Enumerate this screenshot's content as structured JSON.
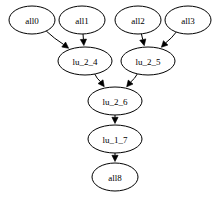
{
  "graph": {
    "kind": "directed-acyclic-graph",
    "layout": "top-to-bottom",
    "background_color": "#ffffff",
    "node_fill_color": "#ffffff",
    "node_stroke_color": "#000000",
    "edge_color": "#000000",
    "label_color": "#000000",
    "nodes": [
      {
        "id": "all0",
        "label": "all0",
        "cx": 32,
        "cy": 20,
        "rx": 23,
        "ry": 14,
        "layer": 0
      },
      {
        "id": "all1",
        "label": "all1",
        "cx": 82,
        "cy": 20,
        "rx": 23,
        "ry": 14,
        "layer": 0
      },
      {
        "id": "all2",
        "label": "all2",
        "cx": 138,
        "cy": 20,
        "rx": 23,
        "ry": 14,
        "layer": 0
      },
      {
        "id": "all3",
        "label": "all3",
        "cx": 188,
        "cy": 20,
        "rx": 23,
        "ry": 14,
        "layer": 0
      },
      {
        "id": "lu_2_4",
        "label": "lu_2_4",
        "cx": 85,
        "cy": 61,
        "rx": 27,
        "ry": 14,
        "layer": 1
      },
      {
        "id": "lu_2_5",
        "label": "lu_2_5",
        "cx": 148,
        "cy": 61,
        "rx": 27,
        "ry": 14,
        "layer": 1
      },
      {
        "id": "lu_2_6",
        "label": "lu_2_6",
        "cx": 115,
        "cy": 101,
        "rx": 27,
        "ry": 14,
        "layer": 2
      },
      {
        "id": "lu_1_7",
        "label": "lu_1_7",
        "cx": 115,
        "cy": 139,
        "rx": 27,
        "ry": 14,
        "layer": 3
      },
      {
        "id": "all8",
        "label": "all8",
        "cx": 115,
        "cy": 177,
        "rx": 23,
        "ry": 14,
        "layer": 4
      }
    ],
    "edges": [
      {
        "from": "all0",
        "to": "lu_2_4",
        "directed": true
      },
      {
        "from": "all1",
        "to": "lu_2_4",
        "directed": true
      },
      {
        "from": "all2",
        "to": "lu_2_5",
        "directed": true
      },
      {
        "from": "all3",
        "to": "lu_2_5",
        "directed": true
      },
      {
        "from": "lu_2_4",
        "to": "lu_2_6",
        "directed": true
      },
      {
        "from": "lu_2_5",
        "to": "lu_2_6",
        "directed": true
      },
      {
        "from": "lu_2_6",
        "to": "lu_1_7",
        "directed": true
      },
      {
        "from": "lu_1_7",
        "to": "all8",
        "directed": true
      }
    ]
  }
}
